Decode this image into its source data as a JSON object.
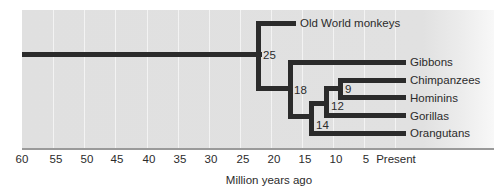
{
  "diagram": {
    "type": "phylogenetic-tree",
    "axis": {
      "title": "Million years ago",
      "ticks": [
        "60",
        "55",
        "50",
        "45",
        "40",
        "35",
        "30",
        "25",
        "20",
        "15",
        "10",
        "5",
        "Present"
      ]
    },
    "taxa": [
      "Old World monkeys",
      "Gibbons",
      "Chimpanzees",
      "Hominins",
      "Gorillas",
      "Orangutans"
    ],
    "nodes": [
      {
        "label": "25",
        "joins": [
          "Old World monkeys",
          "Apes"
        ]
      },
      {
        "label": "18",
        "joins": [
          "Gibbons",
          "Great apes"
        ]
      },
      {
        "label": "14",
        "joins": [
          "Orangutans",
          "African apes"
        ]
      },
      {
        "label": "12",
        "joins": [
          "Gorillas",
          "Chimpanzees+Hominins"
        ]
      },
      {
        "label": "9",
        "joins": [
          "Chimpanzees",
          "Hominins"
        ]
      }
    ],
    "colors": {
      "panel": "#e1e1e1",
      "branch": "#2b2b2b",
      "gridline": "#f3f3f3"
    }
  }
}
